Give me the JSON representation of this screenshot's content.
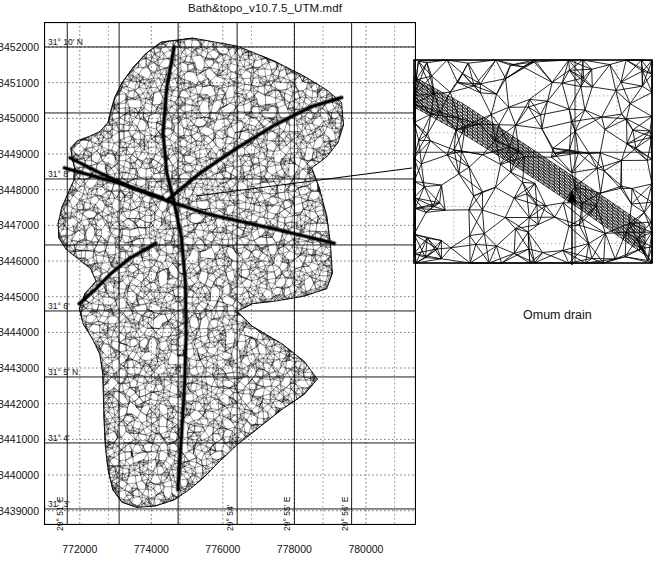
{
  "figure": {
    "title": "Bath&topo_v10.7.5_UTM.mdf",
    "kind": "finite-element triangular mesh map with magnified inset"
  },
  "main_map": {
    "x_axis": {
      "label": "",
      "ticks": [
        "772000",
        "774000",
        "776000",
        "778000",
        "780000"
      ],
      "tick_values": [
        772000,
        774000,
        776000,
        778000,
        780000
      ],
      "minor_step": 200,
      "range": [
        771000,
        781400
      ]
    },
    "y_axis": {
      "label": "",
      "ticks": [
        "3452000",
        "3451000",
        "3450000",
        "3449000",
        "3448000",
        "3447000",
        "3446000",
        "3445000",
        "3444000",
        "3443000",
        "3442000",
        "3441000",
        "3440000",
        "3439000"
      ],
      "tick_values": [
        3452000,
        3451000,
        3450000,
        3449000,
        3448000,
        3447000,
        3446000,
        3445000,
        3444000,
        3443000,
        3442000,
        3441000,
        3440000,
        3439000
      ],
      "minor_step": 200,
      "range": [
        3438600,
        3452700
      ]
    },
    "latitude_labels": [
      {
        "text": "31° 10' N",
        "value": 3452000
      },
      {
        "text": "31° 8'",
        "value": 3448300
      },
      {
        "text": "31° 6'",
        "value": 3444600
      },
      {
        "text": "31° 5' N",
        "value": 3442750
      },
      {
        "text": "31° 4'",
        "value": 3440900
      },
      {
        "text": "31° 3'",
        "value": 3439050
      }
    ],
    "longitude_labels": [
      {
        "text": "29° 51' E",
        "value": 771650
      },
      {
        "text": "29° 54'",
        "value": 776400
      },
      {
        "text": "29° 55' E",
        "value": 778000
      },
      {
        "text": "29° 56' E",
        "value": 779600
      }
    ],
    "grid": {
      "dotted_gridlines": true,
      "solid_graticule": true
    }
  },
  "inset": {
    "caption": "Omum drain",
    "has_arrow": true,
    "arrow_points_to": "dense diagonal channel mesh band",
    "connector_to_main_map": true,
    "mesh_description": "coarse unstructured triangles surrounding a dense quadrilateral-like drain corridor"
  },
  "colors": {
    "mesh_line": "#000000",
    "frame": "#000000",
    "gridline_dotted": "#555555",
    "background": "#ffffff",
    "text": "#111111"
  }
}
